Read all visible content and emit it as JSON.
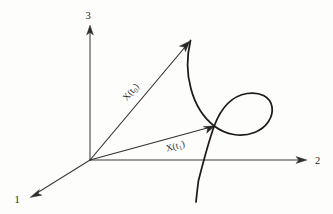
{
  "figure": {
    "background_color": "#fdfdfc",
    "ink_color": "#1e1a18"
  },
  "axes": {
    "vertical": {
      "name": "axis-3",
      "label": "3",
      "direction": "up",
      "arrow": true
    },
    "horizontal": {
      "name": "axis-2",
      "label": "2",
      "direction": "right",
      "arrow": true
    },
    "depth": {
      "name": "axis-1",
      "label": "1",
      "direction": "down-left",
      "arrow": true
    },
    "origin": {
      "x": 90,
      "y": 160
    }
  },
  "vectors": [
    {
      "name": "vector-x-t0",
      "label_main": "X(t",
      "label_sub": "0",
      "label_close": ")",
      "label_text": "X(t0)",
      "from": {
        "x": 90,
        "y": 160
      },
      "to": {
        "x": 189,
        "y": 42
      },
      "label_rotation_deg": -50
    },
    {
      "name": "vector-x-t1",
      "label_main": "X(t",
      "label_sub": "1",
      "label_close": ")",
      "label_text": "X(t1)",
      "from": {
        "x": 90,
        "y": 160
      },
      "to": {
        "x": 214,
        "y": 126
      },
      "label_rotation_deg": -15
    }
  ],
  "trajectory": {
    "name": "trajectory-curve",
    "description": "Looping space curve passing through both vector tips",
    "stroke_width": 1.75,
    "self_intersection": {
      "x": 214,
      "y": 126
    },
    "start_point": {
      "x": 190,
      "y": 40
    },
    "end_point": {
      "x": 196,
      "y": 202
    },
    "loop_extent": {
      "right": 273,
      "top": 94,
      "bottom": 135
    }
  }
}
